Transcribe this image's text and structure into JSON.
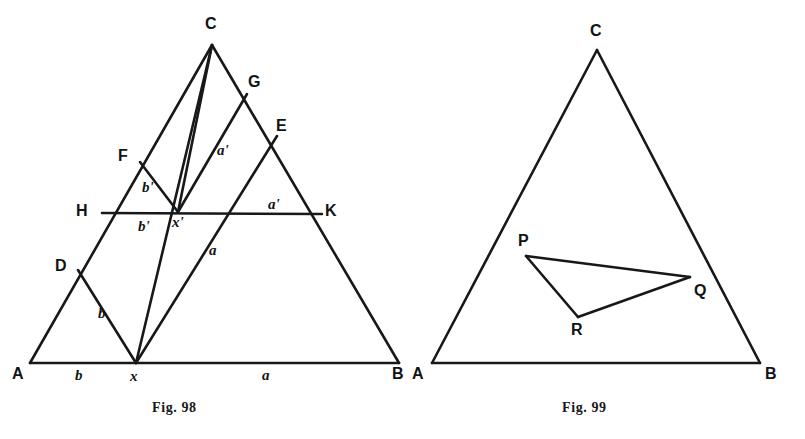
{
  "page": {
    "background": "#ffffff",
    "ink": "#17181a",
    "width": 805,
    "height": 439
  },
  "figures": [
    {
      "id": "fig-98",
      "caption": "Fig. 98",
      "caption_pos": {
        "x": 152,
        "y": 400
      },
      "triangle": {
        "vertices": [
          {
            "name": "A",
            "x": 30,
            "y": 363
          },
          {
            "name": "B",
            "x": 399,
            "y": 363
          },
          {
            "name": "C",
            "x": 212,
            "y": 45
          }
        ]
      },
      "points": [
        {
          "name": "A",
          "x": 30,
          "y": 363,
          "label": "A",
          "lx": 12,
          "ly": 366,
          "style": "vertex"
        },
        {
          "name": "B",
          "x": 399,
          "y": 363,
          "label": "B",
          "lx": 392,
          "ly": 366,
          "style": "vertex"
        },
        {
          "name": "C",
          "x": 212,
          "y": 45,
          "label": "C",
          "lx": 205,
          "ly": 16,
          "style": "vertex"
        },
        {
          "name": "D",
          "x": 78,
          "y": 270,
          "label": "D",
          "lx": 55,
          "ly": 258,
          "style": "vertex"
        },
        {
          "name": "F",
          "x": 140,
          "y": 162,
          "label": "F",
          "lx": 118,
          "ly": 148,
          "style": "vertex"
        },
        {
          "name": "H",
          "x": 102,
          "y": 213,
          "label": "H",
          "lx": 76,
          "ly": 203,
          "style": "vertex"
        },
        {
          "name": "G",
          "x": 247,
          "y": 94,
          "label": "G",
          "lx": 248,
          "ly": 74,
          "style": "vertex"
        },
        {
          "name": "E",
          "x": 277,
          "y": 136,
          "label": "E",
          "lx": 276,
          "ly": 118,
          "style": "vertex"
        },
        {
          "name": "K",
          "x": 322,
          "y": 214,
          "label": "K",
          "lx": 325,
          "ly": 203,
          "style": "vertex"
        },
        {
          "name": "x",
          "x": 136,
          "y": 363,
          "label": "x",
          "lx": 130,
          "ly": 369,
          "style": "math"
        },
        {
          "name": "xp",
          "x": 178,
          "y": 212,
          "label": "x'",
          "lx": 172,
          "ly": 215,
          "style": "math"
        }
      ],
      "segments": [
        {
          "name": "side-AB",
          "from": [
            30,
            363
          ],
          "to": [
            399,
            363
          ]
        },
        {
          "name": "side-AC",
          "from": [
            30,
            363
          ],
          "to": [
            212,
            45
          ]
        },
        {
          "name": "side-CB",
          "from": [
            212,
            45
          ],
          "to": [
            399,
            363
          ]
        },
        {
          "name": "line-HK",
          "from": [
            102,
            213
          ],
          "to": [
            322,
            214
          ]
        },
        {
          "name": "line-Dx",
          "from": [
            78,
            270
          ],
          "to": [
            136,
            363
          ]
        },
        {
          "name": "line-Cx",
          "from": [
            212,
            45
          ],
          "to": [
            136,
            363
          ]
        },
        {
          "name": "line-Fxp",
          "from": [
            140,
            162
          ],
          "to": [
            178,
            212
          ]
        },
        {
          "name": "line-xpG",
          "from": [
            178,
            212
          ],
          "to": [
            247,
            94
          ]
        },
        {
          "name": "line-xE",
          "from": [
            136,
            363
          ],
          "to": [
            277,
            136
          ]
        },
        {
          "name": "line-Cxp",
          "from": [
            212,
            45
          ],
          "to": [
            178,
            212
          ]
        }
      ],
      "measure_labels": [
        {
          "name": "seg-b-base",
          "text": "b",
          "x": 75,
          "y": 368
        },
        {
          "name": "seg-a-base",
          "text": "a",
          "x": 262,
          "y": 368
        },
        {
          "name": "seg-b-Dx",
          "text": "b",
          "x": 98,
          "y": 306
        },
        {
          "name": "seg-bprime-up",
          "text": "b'",
          "x": 142,
          "y": 180
        },
        {
          "name": "seg-bprime-lo",
          "text": "b'",
          "x": 138,
          "y": 219
        },
        {
          "name": "seg-a-xE",
          "text": "a",
          "x": 209,
          "y": 243
        },
        {
          "name": "seg-aprime-up",
          "text": "a'",
          "x": 217,
          "y": 143
        },
        {
          "name": "seg-aprime-HK",
          "text": "a'",
          "x": 268,
          "y": 197
        }
      ]
    },
    {
      "id": "fig-99",
      "caption": "Fig. 99",
      "caption_pos": {
        "x": 562,
        "y": 400
      },
      "triangle": {
        "vertices": [
          {
            "name": "A",
            "x": 432,
            "y": 363
          },
          {
            "name": "B",
            "x": 760,
            "y": 363
          },
          {
            "name": "C",
            "x": 597,
            "y": 50
          }
        ]
      },
      "inner_triangle": {
        "vertices": [
          {
            "name": "P",
            "x": 526,
            "y": 256
          },
          {
            "name": "Q",
            "x": 690,
            "y": 277
          },
          {
            "name": "R",
            "x": 578,
            "y": 317
          }
        ]
      },
      "points": [
        {
          "name": "A",
          "x": 432,
          "y": 363,
          "label": "A",
          "lx": 412,
          "ly": 366,
          "style": "vertex"
        },
        {
          "name": "B",
          "x": 760,
          "y": 363,
          "label": "B",
          "lx": 765,
          "ly": 366,
          "style": "vertex"
        },
        {
          "name": "C",
          "x": 597,
          "y": 50,
          "label": "C",
          "lx": 590,
          "ly": 23,
          "style": "vertex"
        },
        {
          "name": "P",
          "x": 526,
          "y": 256,
          "label": "P",
          "lx": 518,
          "ly": 233,
          "style": "vertex"
        },
        {
          "name": "Q",
          "x": 690,
          "y": 277,
          "label": "Q",
          "lx": 694,
          "ly": 283,
          "style": "vertex"
        },
        {
          "name": "R",
          "x": 578,
          "y": 317,
          "label": "R",
          "lx": 571,
          "ly": 322,
          "style": "vertex"
        }
      ],
      "segments": [
        {
          "name": "side-AB",
          "from": [
            432,
            363
          ],
          "to": [
            760,
            363
          ]
        },
        {
          "name": "side-AC",
          "from": [
            432,
            363
          ],
          "to": [
            597,
            50
          ]
        },
        {
          "name": "side-CB",
          "from": [
            597,
            50
          ],
          "to": [
            760,
            363
          ]
        },
        {
          "name": "side-PQ",
          "from": [
            526,
            256
          ],
          "to": [
            690,
            277
          ]
        },
        {
          "name": "side-QR",
          "from": [
            690,
            277
          ],
          "to": [
            578,
            317
          ]
        },
        {
          "name": "side-RP",
          "from": [
            578,
            317
          ],
          "to": [
            526,
            256
          ]
        }
      ]
    }
  ]
}
